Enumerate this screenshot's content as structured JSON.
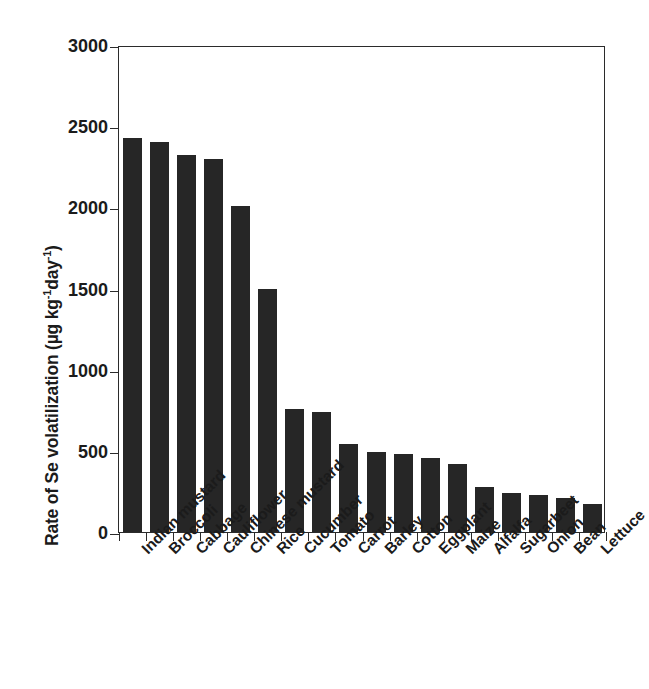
{
  "chart_data": {
    "type": "bar",
    "title": "",
    "xlabel": "",
    "ylabel": "Rate of Se volatilization (µg kg⁻¹day⁻¹)",
    "ylabel_parts": {
      "prefix": "Rate of Se volatilization (µg kg",
      "sup1": "-1",
      "middle": "day",
      "sup2": "-1",
      "suffix": ")"
    },
    "ylim": [
      0,
      3000
    ],
    "yticks": [
      0,
      500,
      1000,
      1500,
      2000,
      2500,
      3000
    ],
    "ytick_labels": [
      "0",
      "500",
      "1000",
      "1500",
      "2000",
      "2500",
      "3000"
    ],
    "grid": false,
    "legend": "none",
    "bar_color": "#262626",
    "axis_color": "#2b2b2b",
    "categories": [
      "Indian mustard",
      "Broccoli",
      "Cabbage",
      "Cauliflower",
      "Chinese mustard",
      "Rice",
      "Cucumber",
      "Tomato",
      "Carrot",
      "Barley",
      "Cotton",
      "Eggplant",
      "Maize",
      "Alfalfa",
      "Sugarbeet",
      "Onion",
      "Bean",
      "Lettuce"
    ],
    "values": [
      2430,
      2400,
      2320,
      2295,
      2010,
      1495,
      755,
      740,
      545,
      490,
      480,
      455,
      420,
      275,
      240,
      225,
      210,
      175
    ]
  }
}
